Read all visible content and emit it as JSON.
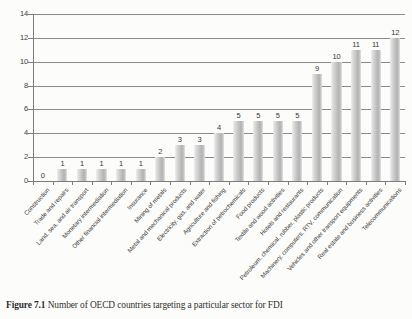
{
  "caption": {
    "label": "Figure 7.1",
    "text": "Number of OECD countries targeting a particular sector for FDI"
  },
  "chart_data": {
    "type": "bar",
    "title": "",
    "xlabel": "",
    "ylabel": "",
    "ylim": [
      0,
      14
    ],
    "yticks": [
      0,
      2,
      4,
      6,
      8,
      10,
      12,
      14
    ],
    "grid": true,
    "legend": false,
    "data_labels": true,
    "bar_color": "#bdbdbd",
    "categories": [
      "Construction",
      "Trade and repairs",
      "Land, sea, and air transport",
      "Monetary intermediation",
      "Other financial intermediation",
      "Insurance",
      "Mining of metals",
      "Metal and mechanical products",
      "Electricity, gas, and water",
      "Agriculture and fishing",
      "Extraction of petrochemicals",
      "Food products",
      "Textile and wood activities",
      "Hotels and restaurants",
      "Petroleum, chemical, rubber, plastic products",
      "Machinery, computers, RTV, communication",
      "Vehicles and other transport equipments",
      "Real estate and business activities",
      "Telecommunications"
    ],
    "values": [
      0,
      1,
      1,
      1,
      1,
      1,
      2,
      3,
      3,
      4,
      5,
      5,
      5,
      5,
      9,
      10,
      11,
      11,
      12
    ]
  }
}
